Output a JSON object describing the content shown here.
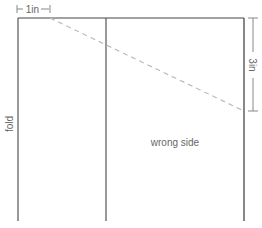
{
  "diagram": {
    "labels": {
      "top_measure": "1in",
      "right_measure": "3in",
      "fold": "fold",
      "wrong_side": "wrong side"
    },
    "colors": {
      "outline": "#444444",
      "dashed": "#bbbbbb",
      "measure": "#888888",
      "text": "#666666"
    }
  }
}
